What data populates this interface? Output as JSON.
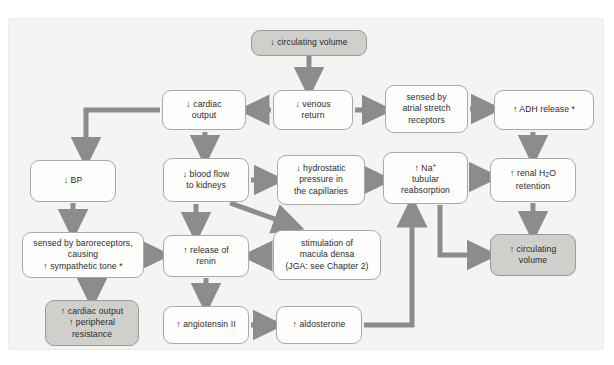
{
  "figure": {
    "type": "flowchart",
    "panel_background": "#f4f4f2",
    "arrow_color": "#8c8c8c",
    "node_fill": "#fdfdfc",
    "node_shaded_fill": "#cfcfcb",
    "node_border": "#a9a9a9"
  },
  "nodes": [
    {
      "id": "circ_down",
      "label": "↓ circulating volume",
      "shaded": true,
      "x": 251,
      "y": 30,
      "w": 116,
      "h": 26
    },
    {
      "id": "cardiac_out_down",
      "label": "↓ cardiac\noutput",
      "shaded": false,
      "x": 162,
      "y": 90,
      "w": 84,
      "h": 40
    },
    {
      "id": "venous_return",
      "label": "↓ venous\nreturn",
      "shaded": false,
      "x": 273,
      "y": 90,
      "w": 80,
      "h": 40
    },
    {
      "id": "atrial_stretch",
      "label": "sensed by\natrial stretch\nreceptors",
      "shaded": false,
      "x": 385,
      "y": 85,
      "w": 83,
      "h": 48
    },
    {
      "id": "adh_release",
      "label": "↑ ADH release *",
      "shaded": false,
      "x": 494,
      "y": 90,
      "w": 100,
      "h": 40
    },
    {
      "id": "bp_down",
      "label": "↓ BP",
      "shaded": false,
      "x": 30,
      "y": 160,
      "w": 86,
      "h": 42
    },
    {
      "id": "blood_flow",
      "label": "↓ blood flow\nto kidneys",
      "shaded": false,
      "x": 163,
      "y": 158,
      "w": 86,
      "h": 44
    },
    {
      "id": "hydrostatic",
      "label": "↓ hydrostatic\npressure in\nthe capillaries",
      "shaded": false,
      "x": 277,
      "y": 155,
      "w": 88,
      "h": 50
    },
    {
      "id": "na_reabsorb",
      "label": "↑ Na<sup>+</sup>\ntubular\nreabsorption",
      "shaded": false,
      "x": 383,
      "y": 152,
      "w": 85,
      "h": 52
    },
    {
      "id": "renal_h2o",
      "label": "↑ renal H<sub>2</sub>O\nretention",
      "shaded": false,
      "x": 490,
      "y": 158,
      "w": 86,
      "h": 44
    },
    {
      "id": "baroreceptors",
      "label": "sensed by baroreceptors,\ncausing\n↑ sympathetic tone *",
      "shaded": false,
      "x": 22,
      "y": 232,
      "w": 122,
      "h": 46
    },
    {
      "id": "renin",
      "label": "↑ release of\nrenin",
      "shaded": false,
      "x": 163,
      "y": 235,
      "w": 86,
      "h": 42
    },
    {
      "id": "macula_densa",
      "label": "stimulation of\nmacula densa\n(JGA: see Chapter 2)",
      "shaded": false,
      "x": 273,
      "y": 230,
      "w": 108,
      "h": 50
    },
    {
      "id": "circ_up",
      "label": "↑ circulating\nvolume",
      "shaded": true,
      "x": 490,
      "y": 234,
      "w": 86,
      "h": 42
    },
    {
      "id": "cardiac_out_up",
      "label": "↑ cardiac output\n↑ peripheral\nresistance",
      "shaded": true,
      "x": 45,
      "y": 300,
      "w": 94,
      "h": 46
    },
    {
      "id": "angiotensin",
      "label": "↑ angiotensin II",
      "shaded": false,
      "x": 163,
      "y": 306,
      "w": 86,
      "h": 38
    },
    {
      "id": "aldosterone",
      "label": "↑ aldosterone",
      "shaded": false,
      "x": 276,
      "y": 306,
      "w": 86,
      "h": 38
    }
  ],
  "edges": [
    {
      "from": "circ_down",
      "to": "venous_return",
      "style": "straight-down"
    },
    {
      "from": "venous_return",
      "to": "cardiac_out_down",
      "style": "straight-left"
    },
    {
      "from": "venous_return",
      "to": "atrial_stretch",
      "style": "straight-right"
    },
    {
      "from": "atrial_stretch",
      "to": "adh_release",
      "style": "straight-right"
    },
    {
      "from": "cardiac_out_down",
      "to": "bp_down",
      "style": "elbow-left-down"
    },
    {
      "from": "cardiac_out_down",
      "to": "blood_flow",
      "style": "straight-down"
    },
    {
      "from": "blood_flow",
      "to": "hydrostatic",
      "style": "straight-right"
    },
    {
      "from": "blood_flow",
      "to": "renin",
      "style": "straight-down"
    },
    {
      "from": "blood_flow",
      "to": "macula_densa",
      "style": "diagonal-down-right"
    },
    {
      "from": "hydrostatic",
      "to": "na_reabsorb",
      "style": "straight-right"
    },
    {
      "from": "na_reabsorb",
      "to": "renal_h2o",
      "style": "straight-right"
    },
    {
      "from": "adh_release",
      "to": "renal_h2o",
      "style": "straight-down"
    },
    {
      "from": "renal_h2o",
      "to": "circ_up",
      "style": "straight-down"
    },
    {
      "from": "na_reabsorb",
      "to": "circ_up",
      "style": "elbow-down-right"
    },
    {
      "from": "bp_down",
      "to": "baroreceptors",
      "style": "straight-down"
    },
    {
      "from": "baroreceptors",
      "to": "renin",
      "style": "straight-right"
    },
    {
      "from": "baroreceptors",
      "to": "cardiac_out_up",
      "style": "straight-down"
    },
    {
      "from": "macula_densa",
      "to": "renin",
      "style": "straight-left"
    },
    {
      "from": "renin",
      "to": "angiotensin",
      "style": "straight-down"
    },
    {
      "from": "angiotensin",
      "to": "aldosterone",
      "style": "straight-right"
    },
    {
      "from": "aldosterone",
      "to": "na_reabsorb",
      "style": "elbow-right-up"
    }
  ]
}
